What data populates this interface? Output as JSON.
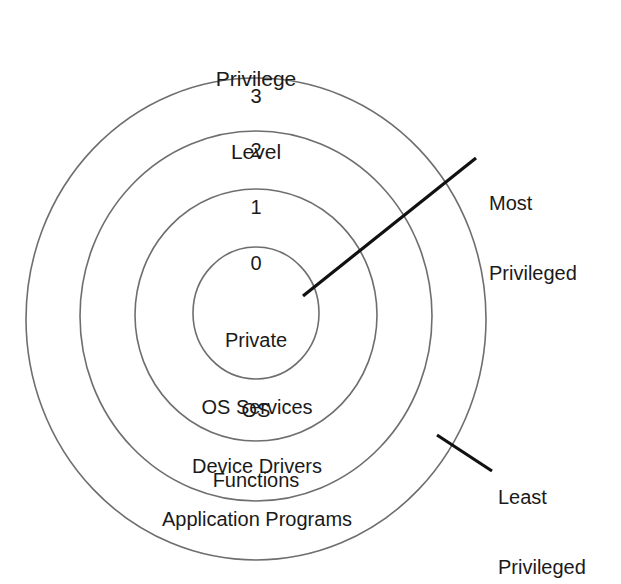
{
  "diagram": {
    "title": "Privilege Level",
    "title_line1": "Privilege",
    "title_line2": "Level",
    "rings": [
      {
        "level": "3",
        "name": "Application Programs",
        "ring_index": 3
      },
      {
        "level": "2",
        "name": "Device Drivers",
        "ring_index": 2
      },
      {
        "level": "1",
        "name": "OS Services",
        "ring_index": 1
      },
      {
        "level": "0",
        "name": "Private OS Functions",
        "name_line1": "Private",
        "name_line2": "OS",
        "name_line3": "Functions",
        "ring_index": 0
      }
    ],
    "callouts": [
      {
        "id": "most-privileged",
        "line1": "Most",
        "line2": "Privileged",
        "text": "Most Privileged"
      },
      {
        "id": "least-privileged",
        "line1": "Least",
        "line2": "Privileged",
        "text": "Least Privileged"
      }
    ],
    "colors": {
      "ring_stroke": "#6e6e6e",
      "leader_line": "#111111",
      "text": "#1a1a1a",
      "background": "#ffffff"
    }
  }
}
